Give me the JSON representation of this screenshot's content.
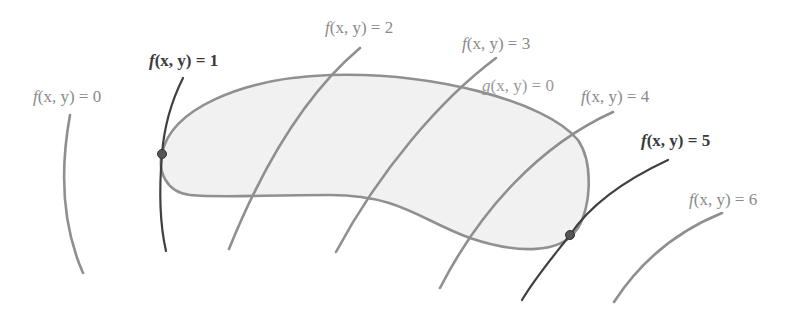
{
  "diagram": {
    "constraint": {
      "label_func": "g",
      "label_args": "(x, y)",
      "label_eq": " = 0"
    },
    "level_curves": [
      {
        "value": "0",
        "label_func": "f",
        "label_args": "(x, y)",
        "label_eq": " = 0",
        "highlighted": false
      },
      {
        "value": "1",
        "label_func": "f",
        "label_args": "(x, y)",
        "label_eq": " = 1",
        "highlighted": true
      },
      {
        "value": "2",
        "label_func": "f",
        "label_args": "(x, y)",
        "label_eq": " = 2",
        "highlighted": false
      },
      {
        "value": "3",
        "label_func": "f",
        "label_args": "(x, y)",
        "label_eq": " = 3",
        "highlighted": false
      },
      {
        "value": "4",
        "label_func": "f",
        "label_args": "(x, y)",
        "label_eq": " = 4",
        "highlighted": false
      },
      {
        "value": "5",
        "label_func": "f",
        "label_args": "(x, y)",
        "label_eq": " = 5",
        "highlighted": true
      },
      {
        "value": "6",
        "label_func": "f",
        "label_args": "(x, y)",
        "label_eq": " = 6",
        "highlighted": false
      }
    ],
    "tangent_points": [
      {
        "curve": "f(x, y) = 1",
        "role": "minimum"
      },
      {
        "curve": "f(x, y) = 5",
        "role": "maximum"
      }
    ],
    "colors": {
      "curve": "#8f8f8f",
      "highlight_curve": "#404040",
      "region_fill": "#f1f1f1",
      "background": "#ffffff"
    }
  }
}
